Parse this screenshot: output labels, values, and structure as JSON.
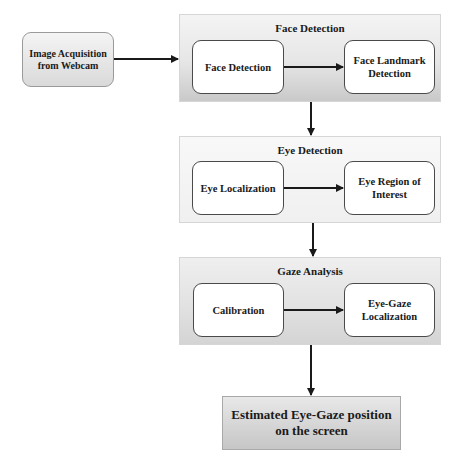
{
  "source": {
    "label": "Image Acquisition from Webcam"
  },
  "stages": [
    {
      "title": "Face Detection",
      "steps": [
        {
          "label": "Face Detection"
        },
        {
          "label": "Face Landmark Detection"
        }
      ]
    },
    {
      "title": "Eye Detection",
      "steps": [
        {
          "label": "Eye Localization"
        },
        {
          "label": "Eye Region of Interest"
        }
      ]
    },
    {
      "title": "Gaze Analysis",
      "steps": [
        {
          "label": "Calibration"
        },
        {
          "label": "Eye-Gaze Localization"
        }
      ]
    }
  ],
  "output": {
    "label": "Estimated Eye-Gaze position on the screen"
  },
  "colors": {
    "arrow": "#1a1a1a",
    "node_border": "#4a4a4a",
    "panel_border": "#d6d6d6"
  }
}
